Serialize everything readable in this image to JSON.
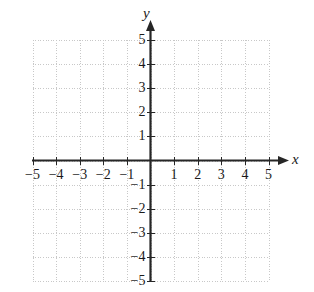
{
  "figure": {
    "background_color": "#ffffff",
    "axis_color": "#262626",
    "grid_color": "#c8c8c8",
    "label_color": "#1a1a1a"
  },
  "axis_letters": {
    "x": "x",
    "y": "y"
  },
  "chart_data": {
    "type": "scatter",
    "title": "",
    "subtitle": "",
    "xlabel": "x",
    "ylabel": "y",
    "xlim": [
      -5,
      5
    ],
    "ylim": [
      -5,
      5
    ],
    "grid": true,
    "grid_style": "dotted",
    "grid_spacing": 1,
    "legend": null,
    "legend_position": "none",
    "x_ticks": [
      -5,
      -4,
      -3,
      -2,
      -1,
      1,
      2,
      3,
      4,
      5
    ],
    "y_ticks": [
      5,
      4,
      3,
      2,
      1,
      -1,
      -2,
      -3,
      -4,
      -5
    ],
    "x_tick_labels": [
      "−5",
      "−4",
      "−3",
      "−2",
      "−1",
      "1",
      "2",
      "3",
      "4",
      "5"
    ],
    "y_tick_labels": [
      "5",
      "4",
      "3",
      "2",
      "1",
      "−1",
      "−2",
      "−3",
      "−4",
      "−5"
    ],
    "series": [],
    "x": [],
    "values": [],
    "annotations": [],
    "arrows": [
      "positive-x",
      "positive-y"
    ]
  }
}
